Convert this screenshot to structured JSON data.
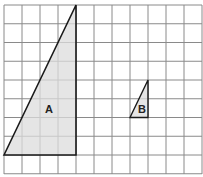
{
  "diagram": {
    "type": "grid-triangles",
    "grid": {
      "columns": 11,
      "rows": 9,
      "line_color": "#8a8a8a",
      "background": "#ffffff"
    },
    "shapes": [
      {
        "label": "A",
        "type": "right-triangle",
        "grid_vertices": [
          [
            0,
            8
          ],
          [
            4,
            0
          ],
          [
            4,
            8
          ]
        ],
        "base_units": 4,
        "height_units": 8,
        "fill": "#dcdcdc",
        "stroke": "#1a1a1a"
      },
      {
        "label": "B",
        "type": "right-triangle",
        "grid_vertices": [
          [
            7,
            6
          ],
          [
            8,
            4
          ],
          [
            8,
            6
          ]
        ],
        "base_units": 1,
        "height_units": 2,
        "fill": "#dcdcdc",
        "stroke": "#1a1a1a"
      }
    ]
  }
}
